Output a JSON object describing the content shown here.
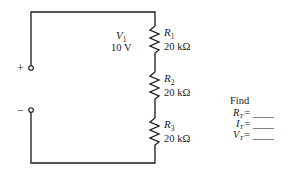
{
  "circuit": {
    "terminals": [
      {
        "name": "positive",
        "symbol": "+"
      },
      {
        "name": "negative",
        "symbol": "−"
      }
    ],
    "source": {
      "label": "V",
      "sub": "1",
      "value": "10 V"
    },
    "resistors": [
      {
        "label": "R",
        "sub": "1",
        "value": "20 kΩ"
      },
      {
        "label": "R",
        "sub": "2",
        "value": "20 kΩ"
      },
      {
        "label": "R",
        "sub": "3",
        "value": "20 kΩ"
      }
    ]
  },
  "find": {
    "title": "Find",
    "items": [
      {
        "label": "R",
        "sub": "T",
        "eq": "= ____"
      },
      {
        "label": "I",
        "sub": "T",
        "eq": "= ____"
      },
      {
        "label": "V",
        "sub": "T",
        "eq": "= ____"
      }
    ]
  }
}
